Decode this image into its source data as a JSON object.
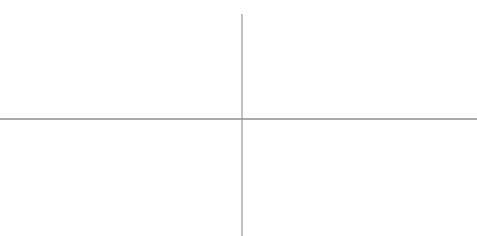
{
  "figure": {
    "clipped_expression": "f(x) = (x-5)(x-4)(x-1)(x+1)(x+4)(x+5)/40 ; f'(x), f''(x)",
    "background_color": "#ffffff"
  },
  "axes": {
    "x_axis": {
      "label": "",
      "origin_px": 242,
      "pixels_per_unit": 36.75,
      "axis_y_px": 119,
      "range": [
        -6.6,
        6.4
      ],
      "tick_values": [
        -6,
        -4,
        -2,
        2,
        4,
        6
      ],
      "tick_labels": [
        "−6",
        "−4",
        "−2",
        "2",
        "4",
        "6"
      ],
      "minor_tick_step": 0.5,
      "axis_color": "#8c8c8c"
    },
    "y_axis": {
      "label": "",
      "origin_px": 119,
      "pixels_per_unit": 2.425,
      "axis_x_px": 242,
      "range": [
        -46,
        41
      ],
      "tick_values": [
        40,
        20,
        -20,
        -40
      ],
      "tick_labels": [
        "40",
        "20",
        "−20",
        "−40"
      ],
      "minor_tick_step": 5,
      "axis_color": "#8c8c8c"
    },
    "grid": false
  },
  "chart_data": {
    "type": "line",
    "title": "",
    "subtitle": "",
    "xlabel": "",
    "ylabel": "",
    "xlim": [
      -6.6,
      6.4
    ],
    "ylim": [
      -46,
      41
    ],
    "xticks": [
      -6,
      -4,
      -2,
      2,
      4,
      6
    ],
    "xticklabels": [
      "−6",
      "−4",
      "−2",
      "2",
      "4",
      "6"
    ],
    "yticks": [
      40,
      20,
      -20,
      -40
    ],
    "yticklabels": [
      "40",
      "20",
      "−20",
      "−40"
    ],
    "grid": false,
    "legend": null,
    "series": [
      {
        "name": "curve",
        "color": "#4d4d4d",
        "line_width": 1,
        "x": [
          -6.6,
          -6.4,
          -6.2,
          -6.0,
          -5.8,
          -5.6,
          -5.4,
          -5.2,
          -5.0,
          -4.8,
          -4.6,
          -4.4,
          -4.2,
          -4.0,
          -3.8,
          -3.6,
          -3.4,
          -3.2,
          -3.0,
          -2.8,
          -2.6,
          -2.4,
          -2.2,
          -2.0,
          -1.8,
          -1.6,
          -1.4,
          -1.2,
          -1.0,
          -0.8,
          -0.6,
          -0.4,
          -0.2,
          0.0,
          0.2,
          0.4,
          0.6,
          0.8,
          1.0,
          1.2,
          1.4,
          1.6,
          1.8,
          2.0,
          2.2,
          2.4,
          2.6,
          2.8,
          3.0,
          3.2,
          3.4,
          3.6,
          3.8,
          4.0,
          4.2,
          4.4,
          4.6,
          4.8,
          5.0,
          5.2,
          5.4,
          5.6,
          5.8,
          6.0,
          6.2,
          6.4
        ],
        "y": [
          12.6,
          12.95,
          12.85,
          12.3,
          11.35,
          10.05,
          8.45,
          6.65,
          4.75,
          2.9,
          1.25,
          -0.05,
          -0.85,
          -1.05,
          -0.7,
          0.1,
          1.15,
          2.25,
          3.2,
          3.9,
          4.25,
          4.25,
          3.9,
          3.25,
          2.45,
          1.6,
          0.8,
          0.2,
          -0.1,
          -0.15,
          -0.05,
          0.0,
          0.0,
          0.0,
          0.0,
          0.0,
          0.05,
          0.15,
          0.1,
          -0.2,
          -0.8,
          -1.6,
          -2.45,
          -3.25,
          -3.9,
          -4.25,
          -4.25,
          -3.9,
          -3.2,
          -2.25,
          -1.15,
          -0.1,
          0.7,
          1.05,
          0.85,
          0.05,
          -1.25,
          -2.9,
          -4.75,
          -6.65,
          -8.45,
          -10.05,
          -11.35,
          -12.3,
          -12.85,
          -12.95
        ],
        "y_display_note": "rendered curve is the visual mirror; see path_points"
      }
    ],
    "markers": [
      {
        "name": "cross-marker",
        "glyph": "✕",
        "x": 3.02,
        "y": 10.3,
        "px": [
          353,
          94
        ],
        "color": "#2b2b2b",
        "size_px": 7
      }
    ],
    "path_points_px": [
      [
        0,
        88
      ],
      [
        6,
        83
      ],
      [
        12,
        78
      ],
      [
        18,
        74
      ],
      [
        24,
        70.5
      ],
      [
        30,
        68.5
      ],
      [
        36,
        68
      ],
      [
        42,
        69
      ],
      [
        48,
        71.5
      ],
      [
        54,
        75
      ],
      [
        60,
        79.5
      ],
      [
        66,
        85
      ],
      [
        72,
        91
      ],
      [
        78,
        97.5
      ],
      [
        84,
        104
      ],
      [
        90,
        110
      ],
      [
        95,
        115
      ],
      [
        99,
        118
      ],
      [
        103,
        120.2
      ],
      [
        107,
        121.2
      ],
      [
        111,
        121.3
      ],
      [
        116,
        120.5
      ],
      [
        121,
        119
      ],
      [
        126,
        117
      ],
      [
        131,
        115.3
      ],
      [
        136,
        113.8
      ],
      [
        142,
        112.6
      ],
      [
        148,
        112.0
      ],
      [
        154,
        112.1
      ],
      [
        160,
        112.8
      ],
      [
        166,
        114.0
      ],
      [
        172,
        115.3
      ],
      [
        178,
        116.5
      ],
      [
        184,
        117.5
      ],
      [
        190,
        118.2
      ],
      [
        196,
        118.6
      ],
      [
        203,
        118.9
      ],
      [
        210,
        119.0
      ],
      [
        218,
        119.0
      ],
      [
        226,
        119.0
      ],
      [
        234,
        119.0
      ],
      [
        242,
        119.0
      ],
      [
        250,
        119.0
      ],
      [
        258,
        118.9
      ],
      [
        265,
        118.6
      ],
      [
        271,
        118.2
      ],
      [
        277,
        117.5
      ],
      [
        283,
        116.5
      ],
      [
        289,
        115.3
      ],
      [
        295,
        114.0
      ],
      [
        301,
        112.8
      ],
      [
        307,
        112.1
      ],
      [
        313,
        112.0
      ],
      [
        319,
        112.6
      ],
      [
        325,
        113.8
      ],
      [
        330,
        115.3
      ],
      [
        335,
        117.0
      ],
      [
        340,
        119.0
      ],
      [
        344,
        120.5
      ],
      [
        348,
        121.3
      ],
      [
        352,
        121.2
      ],
      [
        356,
        120.2
      ],
      [
        360,
        118
      ],
      [
        364,
        115
      ],
      [
        369,
        110
      ],
      [
        375,
        104
      ],
      [
        381,
        97.5
      ],
      [
        387,
        91
      ],
      [
        392,
        85
      ],
      [
        397,
        79.5
      ],
      [
        403,
        75
      ],
      [
        409,
        71.5
      ],
      [
        415,
        69
      ],
      [
        421,
        68
      ],
      [
        427,
        68.5
      ],
      [
        433,
        70.5
      ],
      [
        439,
        74
      ],
      [
        445,
        78
      ],
      [
        451,
        83
      ],
      [
        457,
        88
      ],
      [
        463,
        93
      ],
      [
        469,
        98
      ],
      [
        477,
        104
      ]
    ]
  }
}
